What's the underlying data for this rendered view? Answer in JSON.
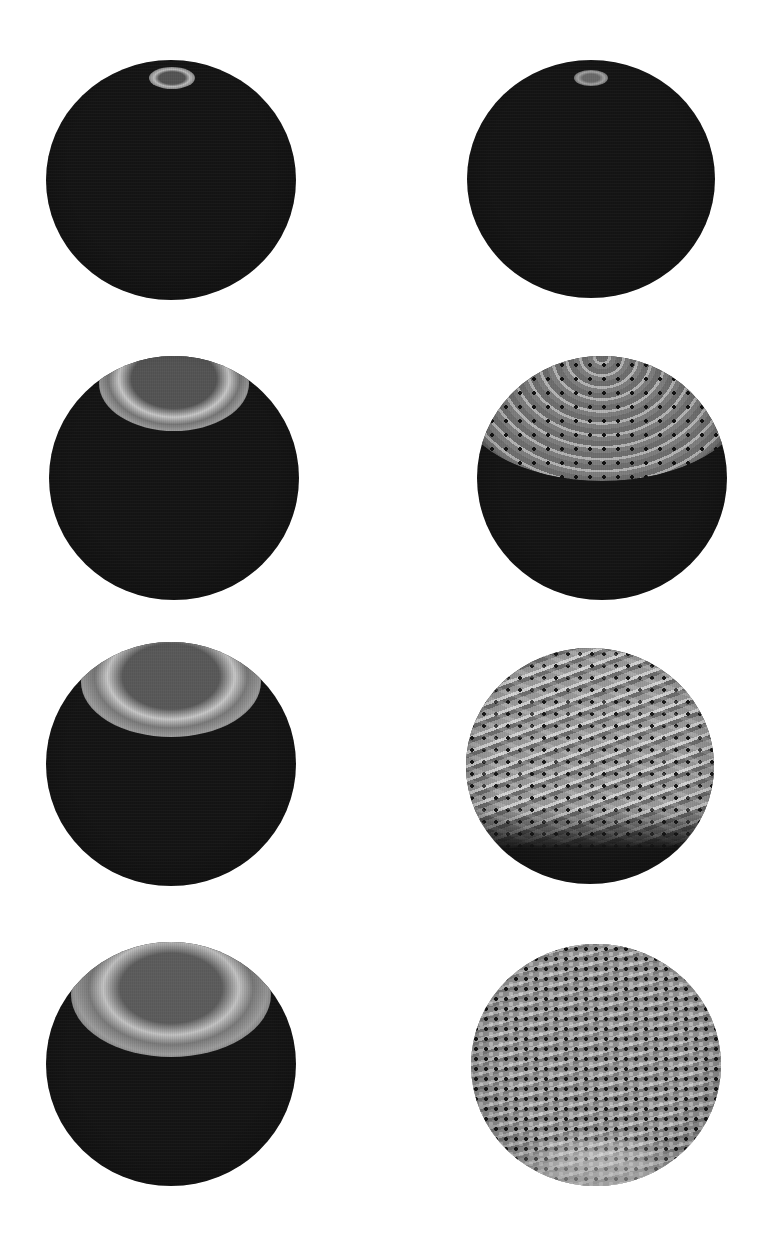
{
  "figure": {
    "layout": {
      "rows": 4,
      "columns": 2
    },
    "background": "#ffffff",
    "panels": [
      {
        "id": "s1",
        "row": 1,
        "column": 1,
        "description": "dark sphere, small bright ring at top pole"
      },
      {
        "id": "s2",
        "row": 1,
        "column": 2,
        "description": "dark sphere, small faint spot at top pole"
      },
      {
        "id": "s3",
        "row": 2,
        "column": 1,
        "description": "dark sphere, concentric bright ring bands near top"
      },
      {
        "id": "s4",
        "row": 2,
        "column": 2,
        "description": "sphere with hexagonal lattice pattern covering upper cap"
      },
      {
        "id": "s5",
        "row": 3,
        "column": 1,
        "description": "dark sphere, wider ring bands near top"
      },
      {
        "id": "s6",
        "row": 3,
        "column": 2,
        "description": "sphere with striped lattice pattern over upper two-thirds"
      },
      {
        "id": "s7",
        "row": 4,
        "column": 1,
        "description": "dark sphere, broad diffuse ring bands near top"
      },
      {
        "id": "s8",
        "row": 4,
        "column": 2,
        "description": "sphere fully covered with dotted hexagonal lattice pattern"
      }
    ],
    "colors": {
      "sphere_dark": "#151515",
      "ring_bright": "#c8c8c8",
      "lattice_gray": "#8a8a8a",
      "lattice_dot": "#151515"
    }
  }
}
